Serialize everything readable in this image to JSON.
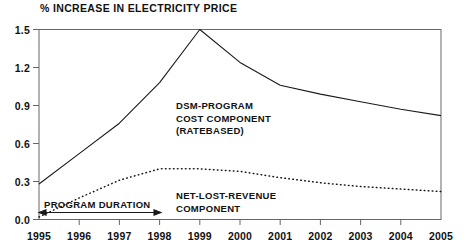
{
  "chart_data": {
    "type": "line",
    "title": "% INCREASE IN ELECTRICITY PRICE",
    "xlabel": "",
    "ylabel": "",
    "xlim": [
      1995,
      2005
    ],
    "ylim": [
      0.0,
      1.5
    ],
    "grid": false,
    "legend_position": "inline-annotations",
    "x": [
      1995,
      1996,
      1997,
      1998,
      1999,
      2000,
      2001,
      2002,
      2003,
      2004,
      2005
    ],
    "y_ticks": [
      "0.0",
      "0.3",
      "0.6",
      "0.9",
      "1.2",
      "1.5"
    ],
    "y_tick_values": [
      0.0,
      0.3,
      0.6,
      0.9,
      1.2,
      1.5
    ],
    "x_ticks": [
      "1995",
      "1996",
      "1997",
      "1998",
      "1999",
      "2000",
      "2001",
      "2002",
      "2003",
      "2004",
      "2005"
    ],
    "series": [
      {
        "name": "DSM-PROGRAM COST COMPONENT (RATEBASED)",
        "style": "solid",
        "color": "#1a1a1a",
        "values": [
          0.28,
          0.52,
          0.76,
          1.08,
          1.5,
          1.24,
          1.06,
          0.99,
          0.93,
          0.87,
          0.82
        ]
      },
      {
        "name": "NET-LOST-REVENUE COMPONENT",
        "style": "dotted",
        "color": "#1a1a1a",
        "values": [
          0.02,
          0.17,
          0.31,
          0.4,
          0.4,
          0.38,
          0.33,
          0.29,
          0.26,
          0.24,
          0.22
        ]
      }
    ],
    "annotations": [
      {
        "name": "dsm-program-label",
        "lines": [
          "DSM-PROGRAM",
          "COST COMPONENT",
          "(RATEBASED)"
        ]
      },
      {
        "name": "net-lost-revenue-label",
        "lines": [
          "NET-LOST-REVENUE",
          "COMPONENT"
        ]
      },
      {
        "name": "program-duration-label",
        "text": "PROGRAM DURATION",
        "span_start": 1995,
        "span_end": 1998
      }
    ]
  },
  "labels": {
    "title": "% INCREASE IN ELECTRICITY PRICE",
    "y0": "0.0",
    "y1": "0.3",
    "y2": "0.6",
    "y3": "0.9",
    "y4": "1.2",
    "y5": "1.5",
    "x0": "1995",
    "x1": "1996",
    "x2": "1997",
    "x3": "1998",
    "x4": "1999",
    "x5": "2000",
    "x6": "2001",
    "x7": "2002",
    "x8": "2003",
    "x9": "2004",
    "x10": "2005",
    "dsm_line1": "DSM-PROGRAM",
    "dsm_line2": "COST COMPONENT",
    "dsm_line3": "(RATEBASED)",
    "nlr_line1": "NET-LOST-REVENUE",
    "nlr_line2": "COMPONENT",
    "duration": "PROGRAM DURATION"
  },
  "colors": {
    "ink": "#1a1a1a",
    "frame": "#555555",
    "background": "#ffffff"
  }
}
